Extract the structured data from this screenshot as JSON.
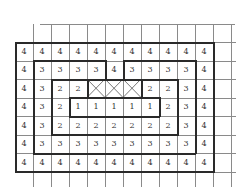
{
  "figure": {
    "grid": {
      "rows": 7,
      "cols": 11,
      "origin_x": 15,
      "origin_y": 42,
      "cell_w": 18,
      "cell_h": 18.5,
      "ext_top_lines": 1,
      "ext_bottom_lines": 1,
      "ext_right_cols": 1,
      "values": [
        [
          "4",
          "4",
          "4",
          "4",
          "4",
          "4",
          "4",
          "4",
          "4",
          "4",
          "4"
        ],
        [
          "4",
          "3",
          "3",
          "3",
          "3",
          "4",
          "3",
          "3",
          "3",
          "3",
          "4"
        ],
        [
          "4",
          "3",
          "2",
          "2",
          "X",
          "X",
          "X",
          "2",
          "2",
          "3",
          "4"
        ],
        [
          "4",
          "3",
          "2",
          "1",
          "1",
          "1",
          "1",
          "1",
          "2",
          "3",
          "4"
        ],
        [
          "4",
          "3",
          "2",
          "2",
          "2",
          "2",
          "2",
          "2",
          "2",
          "3",
          "4"
        ],
        [
          "4",
          "3",
          "3",
          "3",
          "3",
          "3",
          "3",
          "3",
          "3",
          "3",
          "4"
        ],
        [
          "4",
          "4",
          "4",
          "4",
          "4",
          "4",
          "4",
          "4",
          "4",
          "4",
          "4"
        ]
      ],
      "regions": [
        [
          "A",
          "A",
          "A",
          "A",
          "A",
          "A",
          "A",
          "A",
          "A",
          "A",
          "A"
        ],
        [
          "A",
          "B",
          "B",
          "B",
          "B",
          "A",
          "B",
          "B",
          "B",
          "B",
          "A"
        ],
        [
          "A",
          "B",
          "C",
          "C",
          "X",
          "X",
          "X",
          "C",
          "C",
          "B",
          "A"
        ],
        [
          "A",
          "B",
          "C",
          "D",
          "D",
          "D",
          "D",
          "D",
          "C",
          "B",
          "A"
        ],
        [
          "A",
          "B",
          "C",
          "C",
          "C",
          "C",
          "C",
          "C",
          "C",
          "B",
          "A"
        ],
        [
          "A",
          "B",
          "B",
          "B",
          "B",
          "B",
          "B",
          "B",
          "B",
          "B",
          "A"
        ],
        [
          "A",
          "A",
          "A",
          "A",
          "A",
          "A",
          "A",
          "A",
          "A",
          "A",
          "A"
        ]
      ]
    },
    "colors": {
      "thin_line": "#8a8a8a",
      "thick_line": "#2a2a2a",
      "text": "#333333",
      "background": "#ffffff"
    }
  }
}
